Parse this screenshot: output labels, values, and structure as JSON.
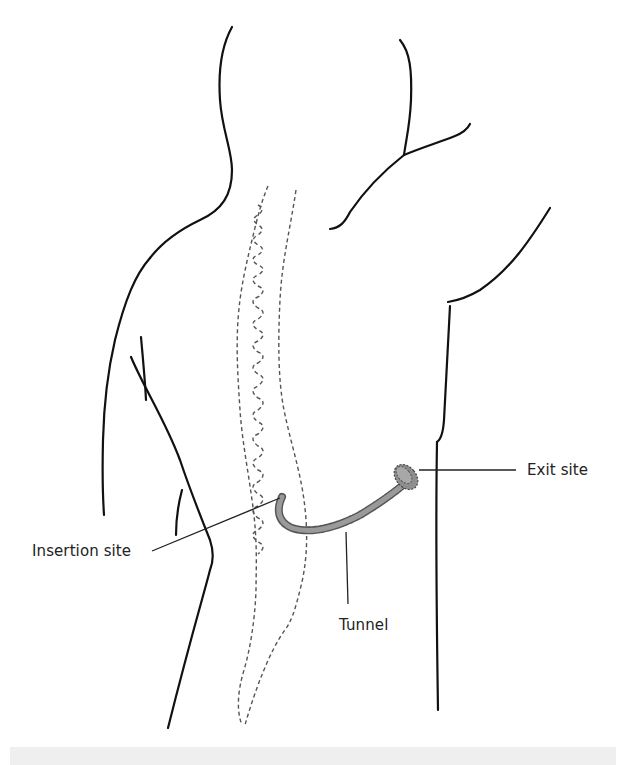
{
  "figure": {
    "labels": {
      "exit_site": "Exit site",
      "insertion_site": "Insertion site",
      "tunnel": "Tunnel"
    },
    "colors": {
      "outline": "#111111",
      "dashed": "#555555",
      "catheter_fill": "#9a9a9a",
      "catheter_edge": "#555555",
      "band": "#efefef"
    }
  }
}
